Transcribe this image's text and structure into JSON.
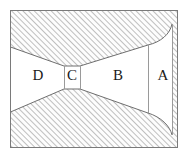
{
  "figure": {
    "frame": {
      "x": 10.5,
      "y": 10.5,
      "width": 167,
      "height": 137,
      "stroke_color": "#7a7a7a",
      "fill_color": "#ffffff"
    },
    "hatch": {
      "pattern": "diagonal-lines-45",
      "line_color": "#8c8c8c",
      "background_color": "#fdfdfd",
      "spacing_px": 4,
      "line_width_px": 1.1
    },
    "channel_fill": "#ffffff",
    "outline_color": "#6e6e6e",
    "divider_color": "#9a9a9a",
    "regions": [
      {
        "id": "region-d",
        "label": "D",
        "label_x": 38,
        "label_y": 77,
        "description": "Wide left inlet section"
      },
      {
        "id": "region-c",
        "label": "C",
        "label_x": 72,
        "label_y": 77,
        "description": "Narrow rectangular throat"
      },
      {
        "id": "region-b",
        "label": "B",
        "label_x": 118,
        "label_y": 77,
        "description": "Expanding right section"
      },
      {
        "id": "region-a",
        "label": "A",
        "label_x": 163,
        "label_y": 77,
        "description": "Rightmost vertical exit strip"
      }
    ],
    "throat": {
      "left_x": 64,
      "right_x": 80,
      "top_y": 66,
      "bottom_y": 89
    },
    "dividers": [
      {
        "id": "divider-throat-left",
        "x": 64,
        "y1": 66,
        "y2": 89
      },
      {
        "id": "divider-throat-right",
        "x": 80,
        "y1": 66,
        "y2": 89
      },
      {
        "id": "divider-b-a",
        "x": 148,
        "y1": 45,
        "y2": 113
      }
    ],
    "upper_boundary": {
      "description": "Lower edge of upper hatched body: slopes down-right from left wall to throat, then rises right to exit and curves at the right wall.",
      "path": "M 10.5 47 L 64 66 L 80 66 L 148 45 C 161 42 170 34 172 24"
    },
    "lower_boundary": {
      "description": "Upper edge of lower hatched body: slopes up-right from left wall to throat, then falls right to exit and curves at the right wall.",
      "path": "M 10.5 112 L 64 89 L 80 89 L 148 113 C 161 117 170 126 172 135"
    }
  }
}
